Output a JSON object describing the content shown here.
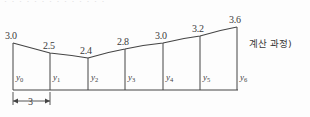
{
  "figure": {
    "name": "trapezoidal-rule-strip-diagram",
    "clipped_text_above": "· · · · · · · · · · · · · ·",
    "side_note": "계산 과정)",
    "width_dimension_label": "3",
    "stroke_color": "#444444",
    "background_color": "#fdfdfd",
    "baseline_y": 90,
    "ordinate_labels": [
      "y<sub>0</sub>",
      "y<sub>1</sub>",
      "y<sub>2</sub>",
      "y<sub>3</sub>",
      "y<sub>4</sub>",
      "y<sub>5</sub>",
      "y<sub>6</sub>"
    ]
  },
  "chart_data": {
    "type": "area",
    "title": "",
    "subtitle": "",
    "xlabel": "",
    "ylabel": "",
    "grid": false,
    "legend": "none",
    "strip_width": 3,
    "n_strips": 6,
    "categories": [
      "y0",
      "y1",
      "y2",
      "y3",
      "y4",
      "y5",
      "y6"
    ],
    "x": [
      0,
      3,
      6,
      9,
      12,
      15,
      18
    ],
    "values": [
      3.0,
      2.5,
      2.4,
      2.8,
      3.0,
      3.2,
      3.6
    ],
    "value_labels": [
      "3.0",
      "2.5",
      "2.4",
      "2.8",
      "3.0",
      "3.2",
      "3.6"
    ],
    "xlim": [
      0,
      18
    ],
    "ylim": [
      0,
      3.8
    ],
    "pixel_geometry": {
      "x_px": [
        13,
        50,
        88,
        125,
        163,
        200,
        237
      ],
      "top_y_px": [
        43,
        53,
        58,
        49,
        43,
        36,
        27
      ],
      "baseline_y_px": 90
    },
    "value_label_positions": [
      {
        "text": "3.0",
        "x": 5,
        "y": 30
      },
      {
        "text": "2.5",
        "x": 43,
        "y": 40
      },
      {
        "text": "2.4",
        "x": 80,
        "y": 45
      },
      {
        "text": "2.8",
        "x": 117,
        "y": 36
      },
      {
        "text": "3.0",
        "x": 155,
        "y": 30
      },
      {
        "text": "3.2",
        "x": 192,
        "y": 23
      },
      {
        "text": "3.6",
        "x": 229,
        "y": 14
      }
    ],
    "ordinate_label_positions": [
      {
        "x": 16,
        "y": 72
      },
      {
        "x": 53,
        "y": 72
      },
      {
        "x": 91,
        "y": 72
      },
      {
        "x": 128,
        "y": 72
      },
      {
        "x": 166,
        "y": 72
      },
      {
        "x": 203,
        "y": 72
      },
      {
        "x": 240,
        "y": 72
      }
    ]
  }
}
